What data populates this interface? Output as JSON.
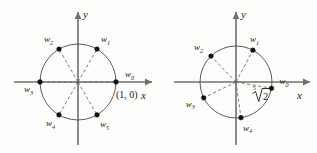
{
  "figure": {
    "background_color": "#fdfdfc",
    "axis_color": "#6f6f6f",
    "circle_color": "#4a4a4a",
    "dash_color": "#5a5a5a",
    "dot_color": "#111111"
  },
  "diagrams": [
    {
      "id": "left-diagram",
      "name": "sixth-roots-of-unity",
      "center_x": 78,
      "center_y": 82,
      "radius": 38,
      "axes": {
        "x_label": "x",
        "y_label": "y"
      },
      "annotations": [
        {
          "name": "origin-coordinate-label",
          "text": "(1, 0)",
          "x": 116,
          "y": 98
        }
      ],
      "points": [
        {
          "label": "w",
          "sub": "0",
          "angle_deg": 0,
          "label_dx": 9,
          "label_dy": -5
        },
        {
          "label": "w",
          "sub": "1",
          "angle_deg": 60,
          "label_dx": 4,
          "label_dy": -7
        },
        {
          "label": "w",
          "sub": "2",
          "angle_deg": 120,
          "label_dx": -15,
          "label_dy": -7
        },
        {
          "label": "w",
          "sub": "3",
          "angle_deg": 180,
          "label_dx": -16,
          "label_dy": 10
        },
        {
          "label": "w",
          "sub": "4",
          "angle_deg": 240,
          "label_dx": -13,
          "label_dy": 11
        },
        {
          "label": "w",
          "sub": "5",
          "angle_deg": 300,
          "label_dx": 3,
          "label_dy": 12
        }
      ]
    },
    {
      "id": "right-diagram",
      "name": "fifth-roots-diagram",
      "center_x": 236,
      "center_y": 82,
      "radius": 36,
      "axes": {
        "x_label": "x",
        "y_label": "y"
      },
      "annotations": [
        {
          "name": "radical-label",
          "index": "5",
          "radicand": "2",
          "x": 252,
          "y": 100
        }
      ],
      "points": [
        {
          "label": "w",
          "sub": "0",
          "angle_deg": -10,
          "label_dx": 8,
          "label_dy": -4
        },
        {
          "label": "w",
          "sub": "1",
          "angle_deg": 62,
          "label_dx": -3,
          "label_dy": -8
        },
        {
          "label": "w",
          "sub": "2",
          "angle_deg": 134,
          "label_dx": -17,
          "label_dy": -6
        },
        {
          "label": "w",
          "sub": "3",
          "angle_deg": 206,
          "label_dx": -18,
          "label_dy": 9
        },
        {
          "label": "w",
          "sub": "4",
          "angle_deg": 278,
          "label_dx": 2,
          "label_dy": 13
        }
      ]
    }
  ]
}
